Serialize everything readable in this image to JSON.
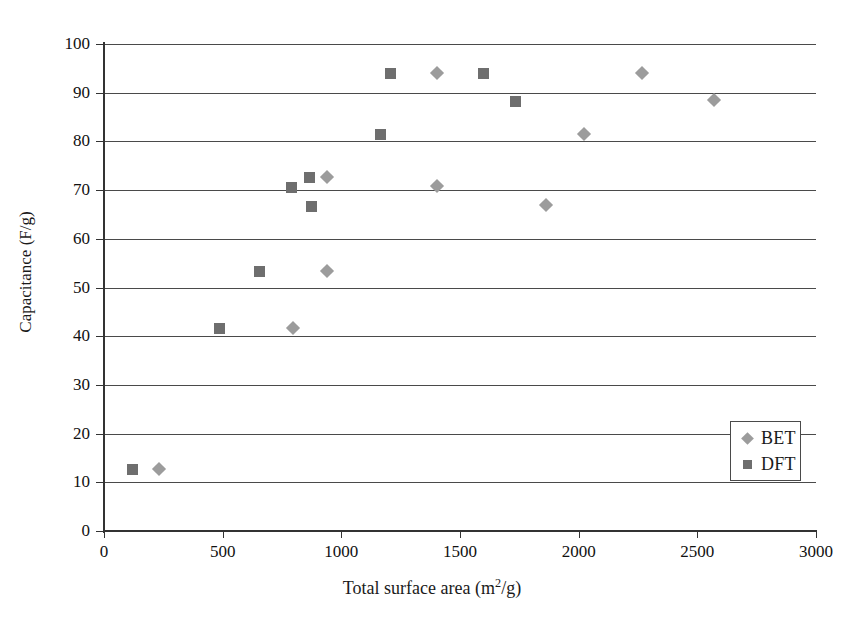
{
  "chart_data": {
    "type": "scatter",
    "title": "",
    "xlabel": "Total surface area (m2/g)",
    "xlabel_parts": {
      "pre": "Total surface area (m",
      "sup": "2",
      "post": "/g)"
    },
    "ylabel": "Capacitance (F/g)",
    "xlim": [
      0,
      3000
    ],
    "ylim": [
      0,
      100
    ],
    "xticks": [
      0,
      500,
      1000,
      1500,
      2000,
      2500,
      3000
    ],
    "yticks": [
      0,
      10,
      20,
      30,
      40,
      50,
      60,
      70,
      80,
      90,
      100
    ],
    "grid": "horizontal",
    "legend_position": "bottom-right",
    "series": [
      {
        "name": "BET",
        "marker": "diamond",
        "color": "#9c9c9c",
        "points": [
          {
            "x": 232,
            "y": 12.7
          },
          {
            "x": 795,
            "y": 41.7
          },
          {
            "x": 940,
            "y": 53.3
          },
          {
            "x": 940,
            "y": 72.7
          },
          {
            "x": 1403,
            "y": 94.0
          },
          {
            "x": 1403,
            "y": 70.9
          },
          {
            "x": 1861,
            "y": 67.0
          },
          {
            "x": 2024,
            "y": 81.6
          },
          {
            "x": 2266,
            "y": 94.0
          },
          {
            "x": 2570,
            "y": 88.5
          }
        ]
      },
      {
        "name": "DFT",
        "marker": "square",
        "color": "#6e6e6e",
        "points": [
          {
            "x": 122,
            "y": 12.7
          },
          {
            "x": 485,
            "y": 41.5
          },
          {
            "x": 657,
            "y": 53.3
          },
          {
            "x": 792,
            "y": 70.5
          },
          {
            "x": 864,
            "y": 72.6
          },
          {
            "x": 876,
            "y": 66.7
          },
          {
            "x": 1167,
            "y": 81.4
          },
          {
            "x": 1209,
            "y": 94.0
          },
          {
            "x": 1601,
            "y": 94.0
          },
          {
            "x": 1732,
            "y": 88.2
          }
        ]
      }
    ]
  },
  "legend": {
    "entries": [
      {
        "label": "BET",
        "marker": "diamond"
      },
      {
        "label": "DFT",
        "marker": "square"
      }
    ]
  }
}
